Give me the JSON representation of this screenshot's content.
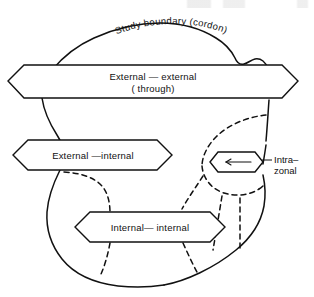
{
  "figure": {
    "background_color": "#ffffff",
    "stroke_color": "#111111",
    "width": 314,
    "height": 297
  },
  "cordon": {
    "label": "Study boundary (cordon)",
    "line_style": "solid"
  },
  "bands": [
    {
      "id": "external-external",
      "label": "External — external",
      "sublabel": "( through)",
      "shape": "double-headed-arrow-band"
    },
    {
      "id": "external-internal",
      "label": "External —internal",
      "sublabel": "",
      "shape": "double-headed-arrow-band"
    },
    {
      "id": "internal-internal",
      "label": "Internal— internal",
      "sublabel": "",
      "shape": "double-headed-arrow-band"
    }
  ],
  "callout": {
    "id": "intra-zonal",
    "label_line1": "Intra–",
    "label_line2": "zonal",
    "shape": "small-arrow-band",
    "arrow_direction": "left"
  },
  "zones": {
    "line_style": "dashed",
    "description": "internal zone divisions inside the cordon"
  }
}
